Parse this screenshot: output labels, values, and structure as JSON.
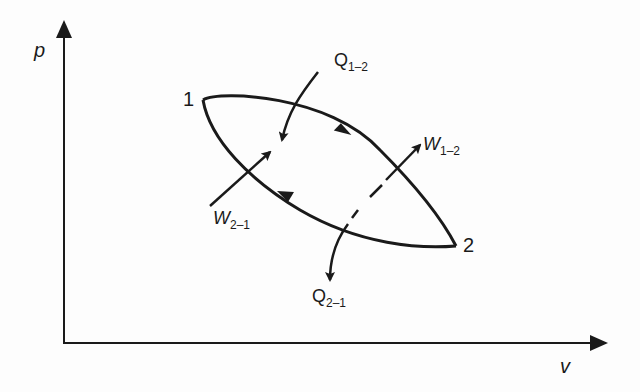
{
  "diagram": {
    "type": "p-v cycle diagram",
    "axes": {
      "y_label": "p",
      "x_label": "v"
    },
    "states": [
      {
        "id": "state-1",
        "label": "1"
      },
      {
        "id": "state-2",
        "label": "2"
      }
    ],
    "processes": [
      {
        "id": "process-1-2",
        "from": "1",
        "to": "2",
        "path": "upper curve"
      },
      {
        "id": "process-2-1",
        "from": "2",
        "to": "1",
        "path": "lower curve"
      }
    ],
    "energy_flows": {
      "q12": {
        "symbol": "Q",
        "subscript": "1–2",
        "direction": "into system"
      },
      "w12": {
        "symbol": "W",
        "subscript": "1–2",
        "direction": "out of system"
      },
      "w21": {
        "symbol": "W",
        "subscript": "2–1",
        "direction": "into system"
      },
      "q21": {
        "symbol": "Q",
        "subscript": "2–1",
        "direction": "out of system"
      }
    },
    "colors": {
      "ink": "#1a1a1a",
      "background": "#fdfdfd"
    }
  }
}
